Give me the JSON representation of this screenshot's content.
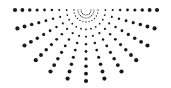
{
  "graphic": {
    "type": "radial-dot-burst",
    "description": "half sunburst of dots fanning downward",
    "dot_color": "#1a1a1a",
    "background": "#ffffff",
    "center": [
      86,
      10
    ],
    "angle_start_deg": 0,
    "angle_end_deg": 180,
    "ray_count": 13,
    "dots_per_ray": 9,
    "inner_radius": 12,
    "outer_radius": 71,
    "min_dot_radius": 0.7,
    "max_dot_radius": 2.1,
    "inner_arcs": [
      {
        "radius": 5,
        "dot_count": 9,
        "dot_radius": 0.6
      },
      {
        "radius": 8,
        "dot_count": 13,
        "dot_radius": 0.6
      }
    ]
  }
}
